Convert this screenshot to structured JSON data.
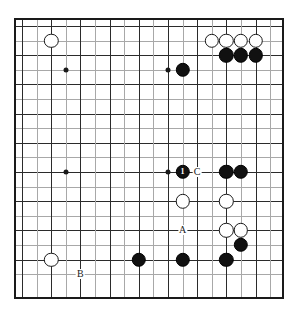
{
  "figure": {
    "kind": "go-board-diagram",
    "background_color": "#ffffff",
    "board_color": "#ffffff",
    "line_color": "#2b2b2b",
    "faint_line_color": "#a8a8a8",
    "border_color": "#1a1a1a",
    "black_color": "#111111",
    "white_color": "#ffffff"
  },
  "board": {
    "columns": 18,
    "rows": 18,
    "cell_size": 14.6,
    "origin_x": 22,
    "origin_y": 26,
    "left": 14,
    "top": 18,
    "width": 270,
    "height": 281,
    "star_points": [
      {
        "col": 4,
        "row": 4
      },
      {
        "col": 11,
        "row": 4
      },
      {
        "col": 4,
        "row": 11
      },
      {
        "col": 11,
        "row": 11
      }
    ]
  },
  "stones": [
    {
      "id": "w-c3-r2",
      "color": "white",
      "col": 3,
      "row": 2
    },
    {
      "id": "w-c14-r2",
      "color": "white",
      "col": 14,
      "row": 2
    },
    {
      "id": "w-c15-r2",
      "color": "white",
      "col": 15,
      "row": 2
    },
    {
      "id": "w-c16-r2",
      "color": "white",
      "col": 16,
      "row": 2
    },
    {
      "id": "w-c17-r2",
      "color": "white",
      "col": 17,
      "row": 2
    },
    {
      "id": "b-c15-r3",
      "color": "black",
      "col": 15,
      "row": 3
    },
    {
      "id": "b-c16-r3",
      "color": "black",
      "col": 16,
      "row": 3
    },
    {
      "id": "b-c17-r3",
      "color": "black",
      "col": 17,
      "row": 3
    },
    {
      "id": "b-c12-r4",
      "color": "black",
      "col": 12,
      "row": 4
    },
    {
      "id": "b-c12-r11",
      "color": "black",
      "col": 12,
      "row": 11,
      "number": "1"
    },
    {
      "id": "b-c15-r11",
      "color": "black",
      "col": 15,
      "row": 11
    },
    {
      "id": "b-c16-r11",
      "color": "black",
      "col": 16,
      "row": 11
    },
    {
      "id": "w-c12-r13",
      "color": "white",
      "col": 12,
      "row": 13
    },
    {
      "id": "w-c15-r13",
      "color": "white",
      "col": 15,
      "row": 13
    },
    {
      "id": "w-c15-r15",
      "color": "white",
      "col": 15,
      "row": 15
    },
    {
      "id": "w-c16-r15",
      "color": "white",
      "col": 16,
      "row": 15
    },
    {
      "id": "b-c16-r16",
      "color": "black",
      "col": 16,
      "row": 16
    },
    {
      "id": "w-c3-r17",
      "color": "white",
      "col": 3,
      "row": 17
    },
    {
      "id": "b-c9-r17",
      "color": "black",
      "col": 9,
      "row": 17
    },
    {
      "id": "b-c12-r17",
      "color": "black",
      "col": 12,
      "row": 17
    },
    {
      "id": "b-c15-r17",
      "color": "black",
      "col": 15,
      "row": 17
    }
  ],
  "labels": [
    {
      "id": "label-c",
      "text": "C",
      "col": 13,
      "row": 11
    },
    {
      "id": "label-a",
      "text": "A",
      "col": 12,
      "row": 15
    },
    {
      "id": "label-b",
      "text": "B",
      "col": 5,
      "row": 18
    }
  ],
  "stone_radius": 7.2,
  "label_font_size": 10,
  "number_font_size": 8
}
